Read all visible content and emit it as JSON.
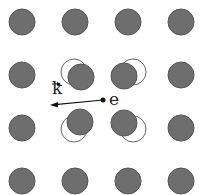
{
  "diagram": {
    "labels": {
      "wavevector": "k",
      "electron": "e"
    },
    "colors": {
      "ion_fill": "#6e6e6e",
      "ion_stroke": "#555555",
      "outline": "#666666",
      "arrow": "#111111"
    },
    "grid": {
      "cols": [
        22,
        75,
        128,
        181
      ],
      "rows": [
        22,
        75,
        128,
        181
      ],
      "radius": 13
    },
    "displaced": [
      {
        "orig": [
          74,
          72
        ],
        "shifted": [
          81,
          77
        ]
      },
      {
        "orig": [
          133,
          72
        ],
        "shifted": [
          124,
          76
        ]
      },
      {
        "orig": [
          74,
          129
        ],
        "shifted": [
          80,
          122
        ]
      },
      {
        "orig": [
          133,
          129
        ],
        "shifted": [
          124,
          123
        ]
      }
    ],
    "electron": {
      "x": 103,
      "y": 100
    },
    "arrow_end": {
      "x": 50,
      "y": 105
    }
  }
}
